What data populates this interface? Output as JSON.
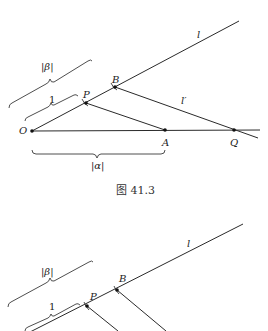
{
  "figure1": {
    "caption": "图 41.3",
    "labels": {
      "O": "O",
      "P": "P",
      "B": "B",
      "A": "A",
      "Q": "Q",
      "l": "l",
      "l_prime": "l′",
      "beta": "|β|",
      "one": "1",
      "alpha": "|α|"
    },
    "points": {
      "O": [
        32,
        131
      ],
      "P": [
        86,
        103
      ],
      "B": [
        115,
        87
      ],
      "A": [
        165,
        130
      ],
      "Q": [
        234,
        130
      ]
    }
  },
  "figure2": {
    "labels": {
      "P": "P",
      "B": "B",
      "l": "l",
      "beta": "|β|",
      "one": "1"
    },
    "points": {
      "P": [
        87,
        306
      ],
      "B": [
        117,
        290
      ]
    }
  }
}
